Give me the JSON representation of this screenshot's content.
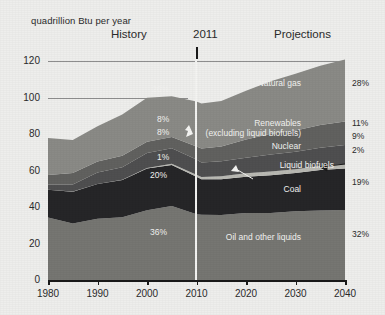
{
  "chart_data": {
    "type": "area",
    "title": "",
    "subtitle": "",
    "ylabel": "quadrillion Btu per year",
    "xlabel": "",
    "ylim": [
      0,
      125
    ],
    "xlim": [
      1980,
      2040
    ],
    "yticks": [
      "0",
      "20",
      "40",
      "60",
      "80",
      "100",
      "120"
    ],
    "ytick_values": [
      0,
      20,
      40,
      60,
      80,
      100,
      120
    ],
    "xticks": [
      "1980",
      "1990",
      "2000",
      "2010",
      "2020",
      "2030",
      "2040"
    ],
    "xtick_values": [
      1980,
      1990,
      2000,
      2010,
      2020,
      2030,
      2040
    ],
    "grid": "horizontal gridlines at 100 and 120 only",
    "legend_position": "inline labels inside areas",
    "annotations": {
      "history_label": "History",
      "divider_year_label": "2011",
      "projections_label": "Projections",
      "divider_year": 2011,
      "nuclear_arrow": "white arrow pointing to nuclear band at 2011",
      "biofuels_arrow": "white leader line to thin liquid biofuels band",
      "biofuels_right_arrow": "dark arrow from 2% label to liquid biofuels band"
    },
    "stack_order_bottom_to_top": [
      "Oil and other liquids",
      "Coal",
      "Liquid biofuels",
      "Nuclear",
      "Renewables (excluding liquid biofuels)",
      "Natural gas"
    ],
    "series": [
      {
        "name": "Oil and other liquids",
        "label": "Oil and other liquids",
        "label_lines": [
          "Oil and other liquids"
        ],
        "share_2011": "36%",
        "share_2040": "32%",
        "color": "#767672",
        "x": [
          1980,
          1985,
          1990,
          1995,
          2000,
          2005,
          2010,
          2011,
          2015,
          2020,
          2025,
          2030,
          2035,
          2040
        ],
        "values": [
          34.2,
          30.9,
          33.6,
          34.6,
          38.3,
          40.4,
          36.0,
          36.1,
          36.0,
          36.4,
          36.8,
          37.3,
          37.9,
          38.4
        ]
      },
      {
        "name": "Coal",
        "label": "Coal",
        "label_lines": [
          "Coal"
        ],
        "share_2011": "20%",
        "share_2040": "19%",
        "color": "#262628",
        "x": [
          1980,
          1985,
          1990,
          1995,
          2000,
          2005,
          2010,
          2011,
          2015,
          2020,
          2025,
          2030,
          2035,
          2040
        ],
        "values": [
          15.4,
          17.5,
          19.2,
          20.1,
          22.6,
          22.8,
          20.8,
          19.6,
          19.3,
          19.8,
          20.6,
          21.3,
          22.0,
          22.8
        ]
      },
      {
        "name": "Liquid biofuels",
        "label": "Liquid biofuels",
        "label_lines": [
          "Liquid biofuels"
        ],
        "share_2011": "1%",
        "share_2040": "2%",
        "color": "#b9b9b3",
        "x": [
          1980,
          1985,
          1990,
          1995,
          2000,
          2005,
          2010,
          2011,
          2015,
          2020,
          2025,
          2030,
          2035,
          2040
        ],
        "values": [
          0.0,
          0.1,
          0.1,
          0.2,
          0.3,
          0.6,
          1.1,
          1.2,
          1.5,
          1.9,
          2.0,
          2.1,
          2.2,
          2.4
        ]
      },
      {
        "name": "Nuclear",
        "label": "Nuclear",
        "label_lines": [
          "Nuclear"
        ],
        "share_2011": "8%",
        "share_2040": "9%",
        "color": "#4f4f50",
        "x": [
          1980,
          1985,
          1990,
          1995,
          2000,
          2005,
          2010,
          2011,
          2015,
          2020,
          2025,
          2030,
          2035,
          2040
        ],
        "values": [
          2.7,
          4.1,
          6.1,
          7.1,
          7.9,
          8.2,
          8.4,
          8.3,
          8.4,
          8.8,
          9.2,
          9.8,
          10.3,
          10.8
        ]
      },
      {
        "name": "Renewables (excluding liquid biofuels)",
        "label": "Renewables",
        "label_lines": [
          "Renewables",
          "(excluding liquid biofuels)"
        ],
        "share_2011": "8%",
        "share_2040": "11%",
        "color": "#61615f",
        "x": [
          1980,
          1985,
          1990,
          1995,
          2000,
          2005,
          2010,
          2011,
          2015,
          2020,
          2025,
          2030,
          2035,
          2040
        ],
        "values": [
          5.5,
          6.1,
          6.0,
          6.6,
          6.1,
          6.2,
          7.5,
          7.7,
          8.5,
          10.1,
          11.2,
          12.0,
          12.7,
          13.3
        ]
      },
      {
        "name": "Natural gas",
        "label": "Natural gas",
        "label_lines": [
          "Natural gas"
        ],
        "share_2011": "26%",
        "share_2040": "28%",
        "color": "#8a8a86",
        "x": [
          1980,
          1985,
          1990,
          1995,
          2000,
          2005,
          2010,
          2011,
          2015,
          2020,
          2025,
          2030,
          2035,
          2040
        ],
        "values": [
          20.4,
          17.7,
          19.6,
          22.7,
          24.0,
          22.6,
          24.7,
          24.9,
          25.2,
          26.5,
          28.8,
          30.7,
          32.5,
          34.3
        ]
      }
    ],
    "left_shares": [
      "26%",
      "8%",
      "8%",
      "1%",
      "20%",
      "36%"
    ],
    "right_shares": [
      "28%",
      "11%",
      "9%",
      "2%",
      "19%",
      "32%"
    ]
  },
  "colors": {
    "background": "#eeeeec",
    "axis": "#1a1a1a",
    "gridline": "#8e8e8e",
    "divider": "#f4f4f2",
    "text_dark": "#2b2b2b",
    "text_light": "#f2f2f0"
  }
}
